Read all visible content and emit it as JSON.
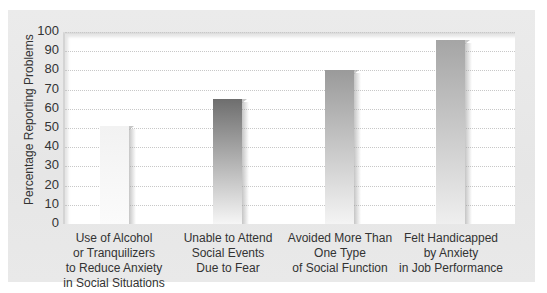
{
  "chart_data": {
    "type": "bar",
    "title": "",
    "xlabel": "",
    "ylabel": "Percentage Reporting Problems",
    "ylim": [
      0,
      100
    ],
    "yticks": [
      "0",
      "10",
      "20",
      "30",
      "40",
      "50",
      "60",
      "70",
      "80",
      "90",
      "100"
    ],
    "grid": true,
    "legend": null,
    "categories": [
      "Use of Alcohol\nor Tranquilizers\nto Reduce Anxiety\nin Social Situations",
      "Unable to Attend\nSocial Events\nDue to Fear",
      "Avoided More Than\nOne Type\nof Social Function",
      "Felt Handicapped\nby Anxiety\nin Job Performance"
    ],
    "values": [
      52,
      66,
      81,
      97
    ]
  },
  "colors": {
    "panel_bg": "#e8e8e8",
    "plot_bg": "#ffffff",
    "bar_gradients": [
      [
        "#f2f2f2",
        "#fbfbfb"
      ],
      [
        "#6e6e6e",
        "#f6f6f6"
      ],
      [
        "#9a9a9a",
        "#f4f4f4"
      ],
      [
        "#a5a5a5",
        "#efefef"
      ]
    ]
  }
}
